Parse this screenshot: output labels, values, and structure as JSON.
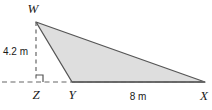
{
  "figure": {
    "kind": "geometry-diagram",
    "shape": "triangle",
    "fill_color": "#dedede",
    "stroke_color": "#555555",
    "dash_color": "#666666",
    "background_color": "#ffffff",
    "text_color": "#1a1a1a"
  },
  "vertices": [
    {
      "id": "W",
      "label": "W",
      "x": 36,
      "y": 22,
      "label_x": 33,
      "label_y": 13
    },
    {
      "id": "Y",
      "label": "Y",
      "x": 72,
      "y": 82,
      "label_x": 69,
      "label_y": 98
    },
    {
      "id": "X",
      "label": "X",
      "x": 205,
      "y": 82,
      "label_x": 200,
      "label_y": 99
    },
    {
      "id": "Z",
      "label": "Z",
      "x": 36,
      "y": 82,
      "label_x": 33,
      "label_y": 98
    }
  ],
  "measurements": [
    {
      "id": "height",
      "value": "4.2 m",
      "x": 4,
      "y": 52,
      "segment": "WZ"
    },
    {
      "id": "base",
      "value": "8 m",
      "x": 124,
      "y": 99,
      "segment": "YX"
    }
  ],
  "markers": {
    "right_angle": {
      "at": "Z",
      "name": "right-angle-marker"
    }
  },
  "segments": {
    "triangle_path": "M 36 22 L 72 82 L 205 82 Z",
    "altitude_dashed": "M 36 22 L 36 82",
    "baseline_dashed": "M 2 82 L 205 82"
  }
}
